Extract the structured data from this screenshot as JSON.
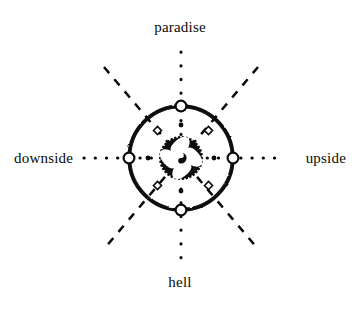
{
  "diagram": {
    "background_color": "#ffffff",
    "ink_color": "#0a0a0a",
    "center": {
      "x": 181,
      "y": 158
    },
    "labels": {
      "top": "paradise",
      "bottom": "hell",
      "left": "downside",
      "right": "upside"
    },
    "axes": [
      {
        "name": "vertical-axis",
        "from": "hell",
        "to": "paradise",
        "style": "dotted",
        "orientation": "vertical"
      },
      {
        "name": "horizontal-axis",
        "from": "downside",
        "to": "upside",
        "style": "dotted",
        "orientation": "horizontal"
      },
      {
        "name": "diagonal-axis-nw-se",
        "style": "dashed",
        "orientation": "diagonal"
      },
      {
        "name": "diagonal-axis-ne-sw",
        "style": "dashed",
        "orientation": "diagonal"
      }
    ],
    "rings": {
      "outer_ring": {
        "name": "outer-ring",
        "radius": 52,
        "style": "hand-drawn-thick-circle",
        "fill": "none",
        "stroke": "#0a0a0a"
      },
      "inner_hub": {
        "name": "inner-hub",
        "radius": 22,
        "style": "toothed-gear-disc",
        "fill": "#0a0a0a",
        "teeth": 34
      }
    },
    "markers": {
      "ring_nodes": {
        "name": "ring-node",
        "count": 4,
        "shape": "open-circle",
        "positions": [
          "top",
          "right",
          "bottom",
          "left"
        ],
        "fill": "#ffffff",
        "stroke": "#0a0a0a"
      },
      "diagonal_nodes": {
        "name": "diagonal-node",
        "count": 4,
        "shape": "small-open-diamond",
        "fill": "#ffffff",
        "stroke": "#0a0a0a"
      },
      "axis_dots": {
        "name": "axis-dot",
        "shape": "filled-dot",
        "fill": "#0a0a0a"
      }
    },
    "hub_motif": {
      "name": "quatrefoil-motif",
      "petals": 4,
      "petal_fill": "#ffffff",
      "core": "yin-yang-swirl"
    }
  }
}
